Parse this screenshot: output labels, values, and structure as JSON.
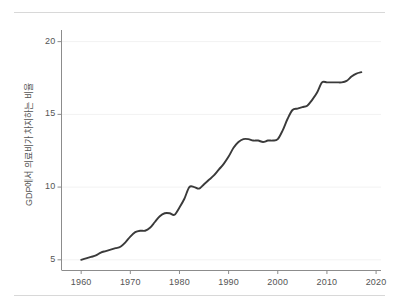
{
  "chart_data": {
    "type": "line",
    "title": "",
    "subtitle": "",
    "xlabel": "",
    "ylabel": "GDP에서 의료비가 차지하는 비율",
    "xlim": [
      1956,
      2021
    ],
    "ylim": [
      4.3,
      20.8
    ],
    "xticks": [
      1960,
      1970,
      1980,
      1990,
      2000,
      2010,
      2020
    ],
    "xtick_labels": [
      "1960",
      "1970",
      "1980",
      "1990",
      "2000",
      "2010",
      "2020"
    ],
    "yticks": [
      5,
      10,
      15,
      20
    ],
    "ytick_labels": [
      "5",
      "10",
      "15",
      "20"
    ],
    "grid": "horizontal-faint",
    "legend": "none",
    "line_color": "#3a3a3a",
    "axis_color": "#8c8c8c",
    "text_color": "#545454",
    "background": "#ffffff",
    "series": [
      {
        "name": "GDP에서 의료비가 차지하는 비율",
        "x": [
          1960,
          1961,
          1962,
          1963,
          1964,
          1965,
          1966,
          1967,
          1968,
          1969,
          1970,
          1971,
          1972,
          1973,
          1974,
          1975,
          1976,
          1977,
          1978,
          1979,
          1980,
          1981,
          1982,
          1983,
          1984,
          1985,
          1986,
          1987,
          1988,
          1989,
          1990,
          1991,
          1992,
          1993,
          1994,
          1995,
          1996,
          1997,
          1998,
          1999,
          2000,
          2001,
          2002,
          2003,
          2004,
          2005,
          2006,
          2007,
          2008,
          2009,
          2010,
          2011,
          2012,
          2013,
          2014,
          2015,
          2016,
          2017
        ],
        "values": [
          5.0,
          5.1,
          5.2,
          5.3,
          5.5,
          5.6,
          5.7,
          5.8,
          5.9,
          6.2,
          6.6,
          6.9,
          7.0,
          7.0,
          7.2,
          7.6,
          8.0,
          8.2,
          8.2,
          8.1,
          8.6,
          9.2,
          10.0,
          10.0,
          9.9,
          10.2,
          10.5,
          10.8,
          11.2,
          11.6,
          12.1,
          12.7,
          13.1,
          13.3,
          13.3,
          13.2,
          13.2,
          13.1,
          13.2,
          13.2,
          13.3,
          13.9,
          14.7,
          15.3,
          15.4,
          15.5,
          15.6,
          16.0,
          16.5,
          17.2,
          17.2,
          17.2,
          17.2,
          17.2,
          17.3,
          17.6,
          17.8,
          17.9
        ]
      }
    ],
    "data_range": {
      "start_year": 1960,
      "end_year": 2017,
      "start_value": 5.0,
      "end_value": 17.9
    }
  }
}
